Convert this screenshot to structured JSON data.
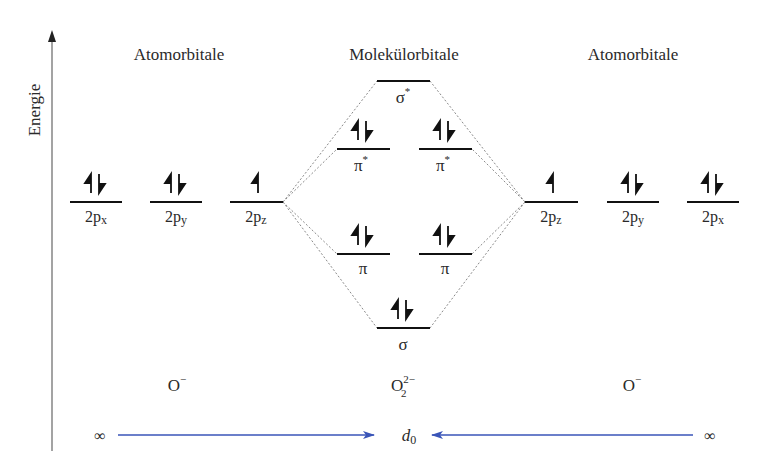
{
  "axis": {
    "label": "Energie",
    "x": 52,
    "y_top": 32,
    "y_bottom": 451
  },
  "headers": {
    "left": "Atomorbitale",
    "center": "Molekülorbitale",
    "right": "Atomorbitale"
  },
  "left_atom": {
    "species": "O",
    "charge": "−",
    "orbitals": [
      {
        "label": "2p",
        "sub": "x",
        "electrons": 2,
        "x1": 70,
        "x2": 122,
        "y": 202
      },
      {
        "label": "2p",
        "sub": "y",
        "electrons": 2,
        "x1": 150,
        "x2": 202,
        "y": 202
      },
      {
        "label": "2p",
        "sub": "z",
        "electrons": 1,
        "x1": 230,
        "x2": 283,
        "y": 202
      }
    ]
  },
  "right_atom": {
    "species": "O",
    "charge": "−",
    "orbitals": [
      {
        "label": "2p",
        "sub": "z",
        "electrons": 1,
        "x1": 525,
        "x2": 578,
        "y": 202
      },
      {
        "label": "2p",
        "sub": "y",
        "electrons": 2,
        "x1": 607,
        "x2": 659,
        "y": 202
      },
      {
        "label": "2p",
        "sub": "x",
        "electrons": 2,
        "x1": 687,
        "x2": 739,
        "y": 202
      }
    ]
  },
  "molecule": {
    "species": "O",
    "subscript": "2",
    "charge": "2−",
    "orbitals": [
      {
        "label": "σ",
        "star": "*",
        "electrons": 0,
        "x1": 377,
        "x2": 430,
        "y": 81
      },
      {
        "label": "π",
        "star": "*",
        "electrons": 2,
        "x1": 337,
        "x2": 390,
        "y": 149
      },
      {
        "label": "π",
        "star": "*",
        "electrons": 2,
        "x1": 419,
        "x2": 472,
        "y": 149
      },
      {
        "label": "π",
        "star": "",
        "electrons": 2,
        "x1": 337,
        "x2": 390,
        "y": 254
      },
      {
        "label": "π",
        "star": "",
        "electrons": 2,
        "x1": 419,
        "x2": 472,
        "y": 254
      },
      {
        "label": "σ",
        "star": "",
        "electrons": 2,
        "x1": 377,
        "x2": 430,
        "y": 328
      }
    ]
  },
  "distance": {
    "left_label": "∞",
    "center_label": "d",
    "center_sub": "0",
    "right_label": "∞",
    "arrow_color": "#3a55b8"
  },
  "colors": {
    "line": "#111111",
    "dash": "#8a8a8a",
    "text": "#2a2a2a",
    "axis": "#555555"
  }
}
